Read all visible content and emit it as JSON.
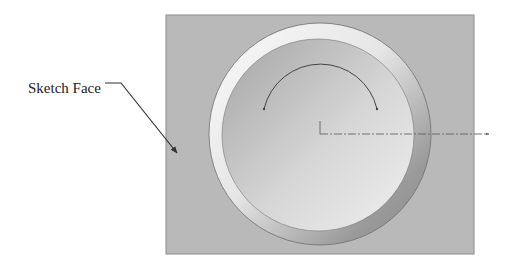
{
  "callout": {
    "label": "Sketch Face"
  },
  "colors": {
    "face": "#b8b8b8",
    "face_border": "#8a8a8a",
    "ring_light": "#f4f4f4",
    "ring_dark": "#8e8e8e",
    "recess_light": "#eeeeee",
    "recess_dark": "#a6a6a6",
    "sketch_line": "#444444"
  }
}
